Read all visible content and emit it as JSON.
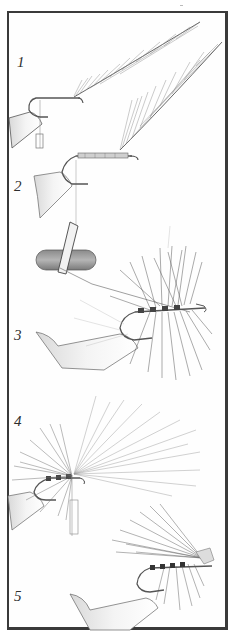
{
  "figure": {
    "type": "illustration",
    "border_color": "#3a3a3a",
    "ink_color": "#4a4a4a",
    "steps": [
      {
        "label": "1",
        "x": 17,
        "y": 54
      },
      {
        "label": "2",
        "x": 14,
        "y": 178
      },
      {
        "label": "3",
        "x": 14,
        "y": 327
      },
      {
        "label": "4",
        "x": 14,
        "y": 413
      },
      {
        "label": "5",
        "x": 14,
        "y": 588
      }
    ]
  }
}
